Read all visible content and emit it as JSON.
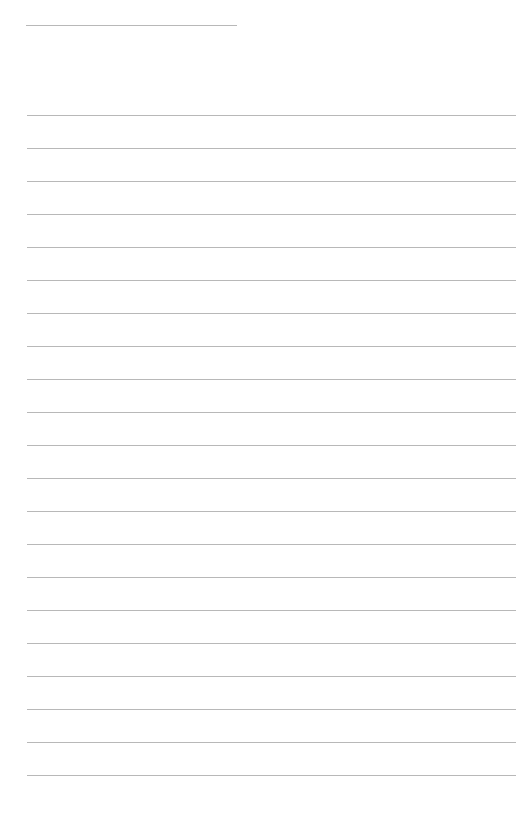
{
  "page": {
    "type": "lined-paper",
    "background_color": "#ffffff",
    "line_color": "#b8b8b8",
    "header_line": {
      "left": 26,
      "top": 25,
      "width": 211,
      "text": ""
    },
    "ruled_lines": {
      "count": 21,
      "first_top": 115,
      "spacing": 33,
      "left": 27,
      "width": 489,
      "lines": [
        "",
        "",
        "",
        "",
        "",
        "",
        "",
        "",
        "",
        "",
        "",
        "",
        "",
        "",
        "",
        "",
        "",
        "",
        "",
        "",
        ""
      ]
    }
  }
}
